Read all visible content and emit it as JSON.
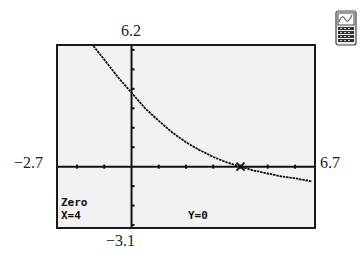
{
  "chart_data": {
    "type": "line",
    "title": "",
    "xlabel": "",
    "ylabel": "",
    "xlim": [
      -2.7,
      6.7
    ],
    "ylim": [
      -3.1,
      6.2
    ],
    "window_labels": {
      "ymax": "6.2",
      "ymin": "−3.1",
      "xmin": "−2.7",
      "xmax": "6.7"
    },
    "grid": false,
    "x_tick_spacing": 1,
    "y_tick_spacing": 1,
    "series": [
      {
        "name": "y",
        "x": [
          -1.4,
          -1,
          -0.5,
          0,
          0.5,
          1,
          1.5,
          2,
          2.5,
          3,
          3.5,
          4,
          4.5,
          5,
          5.5,
          6,
          6.6
        ],
        "values": [
          6.2,
          5.5,
          4.6,
          3.8,
          3.0,
          2.35,
          1.75,
          1.25,
          0.85,
          0.5,
          0.22,
          0,
          -0.2,
          -0.35,
          -0.5,
          -0.6,
          -0.75
        ]
      }
    ],
    "annotations": [
      {
        "type": "marker",
        "shape": "x-cursor",
        "x": 4,
        "y": 0
      }
    ]
  },
  "screen": {
    "mode_label": "Zero",
    "x_readout": "X=4",
    "y_readout": "Y=0"
  },
  "icon": {
    "name": "graphing-calculator-icon"
  }
}
